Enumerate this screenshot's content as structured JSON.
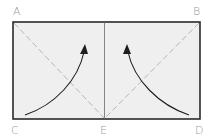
{
  "diagram": {
    "type": "fold-instruction",
    "paper_fill": "#efefef",
    "outline_color": "#2a2a2a",
    "crease_color": "#6a6a6a",
    "fold_line_color": "#b5b5b5",
    "arrow_color": "#1e1e1e",
    "label_color": "#9a9a9a",
    "points": {
      "A": {
        "label": "A",
        "position": "top-left"
      },
      "B": {
        "label": "B",
        "position": "top-right"
      },
      "C": {
        "label": "C",
        "position": "bottom-left"
      },
      "D": {
        "label": "D",
        "position": "bottom-right"
      },
      "E": {
        "label": "E",
        "position": "bottom-center"
      }
    },
    "fold_lines": [
      {
        "from": "A",
        "to": "E",
        "style": "dashed"
      },
      {
        "from": "B",
        "to": "E",
        "style": "dashed"
      }
    ],
    "crease": {
      "position": "vertical-center",
      "style": "solid"
    },
    "arrows": [
      {
        "from": "C",
        "direction": "up-toward-center"
      },
      {
        "from": "D",
        "direction": "up-toward-center"
      }
    ]
  }
}
